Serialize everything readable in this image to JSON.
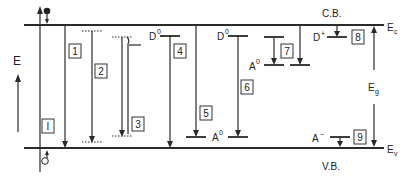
{
  "figure": {
    "axis": {
      "label": "E"
    },
    "bands": {
      "conduction": {
        "name": "C.B.",
        "edge": "E",
        "edge_sub": "c"
      },
      "valence": {
        "name": "V.B.",
        "edge": "E",
        "edge_sub": "v"
      },
      "gap": {
        "label": "E",
        "label_sub": "g"
      }
    },
    "levels": {
      "donor_4": {
        "label": "D",
        "sup": "0"
      },
      "donor_6": {
        "label": "D",
        "sup": "0"
      },
      "acceptor_5": {
        "label": "A",
        "sup": "0"
      },
      "acceptor_7": {
        "label": "A",
        "sup": "0"
      },
      "donor_8": {
        "label": "D",
        "sup": "+"
      },
      "acceptor_9": {
        "label": "A",
        "sup": "−"
      }
    },
    "transitions": [
      {
        "id": "I",
        "label": "I",
        "description": "band-to-band excitation (electron up, hole down)"
      },
      {
        "id": "1",
        "label": "1",
        "description": "conduction band to valence band"
      },
      {
        "id": "2",
        "label": "2",
        "description": "free exciton"
      },
      {
        "id": "3",
        "label": "3",
        "description": "excitonic complex"
      },
      {
        "id": "4",
        "label": "4",
        "description": "donor to valence band"
      },
      {
        "id": "5",
        "label": "5",
        "description": "conduction band to acceptor"
      },
      {
        "id": "6",
        "label": "6",
        "description": "donor-acceptor pair"
      },
      {
        "id": "7",
        "label": "7",
        "description": "shallow to deep level"
      },
      {
        "id": "8",
        "label": "8",
        "description": "electron capture at ionized donor"
      },
      {
        "id": "9",
        "label": "9",
        "description": "hole capture at ionized acceptor"
      }
    ]
  }
}
